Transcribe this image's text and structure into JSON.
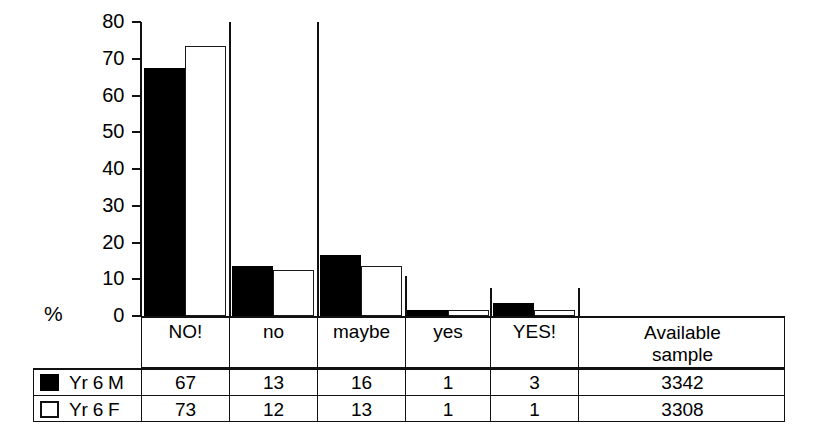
{
  "chart_data": {
    "type": "bar",
    "title": "",
    "subtitle": "",
    "xlabel": "",
    "ylabel": "%",
    "ylim": [
      0,
      80
    ],
    "yticks": [
      0,
      10,
      20,
      30,
      40,
      50,
      60,
      70,
      80
    ],
    "grid": false,
    "legend_position": "table-left",
    "categories": [
      "NO!",
      "no",
      "maybe",
      "yes",
      "YES!"
    ],
    "series": [
      {
        "name": "Yr 6 M",
        "color": "#000000",
        "values": [
          67,
          13,
          16,
          1,
          3
        ],
        "available_sample": 3342
      },
      {
        "name": "Yr 6 F",
        "color": "#ffffff",
        "values": [
          73,
          12,
          13,
          1,
          1
        ],
        "available_sample": 3308
      }
    ]
  },
  "axis": {
    "y_unit_label": "%",
    "tick_labels": [
      "80",
      "70",
      "60",
      "50",
      "40",
      "30",
      "20",
      "10",
      "0"
    ]
  },
  "table": {
    "category_headers": [
      "NO!",
      "no",
      "maybe",
      "yes",
      "YES!"
    ],
    "sample_header_line1": "Available",
    "sample_header_line2": "sample",
    "rows": [
      {
        "legend_label": "Yr 6 M",
        "swatch": "filled-square-icon",
        "values": [
          "67",
          "13",
          "16",
          "1",
          "3"
        ],
        "sample": "3342"
      },
      {
        "legend_label": "Yr 6 F",
        "swatch": "outline-square-icon",
        "values": [
          "73",
          "12",
          "13",
          "1",
          "1"
        ],
        "sample": "3308"
      }
    ]
  },
  "style": {
    "ink": "#111111",
    "series_m_fill": "#000000",
    "series_f_fill": "#ffffff",
    "background": "#ffffff"
  }
}
